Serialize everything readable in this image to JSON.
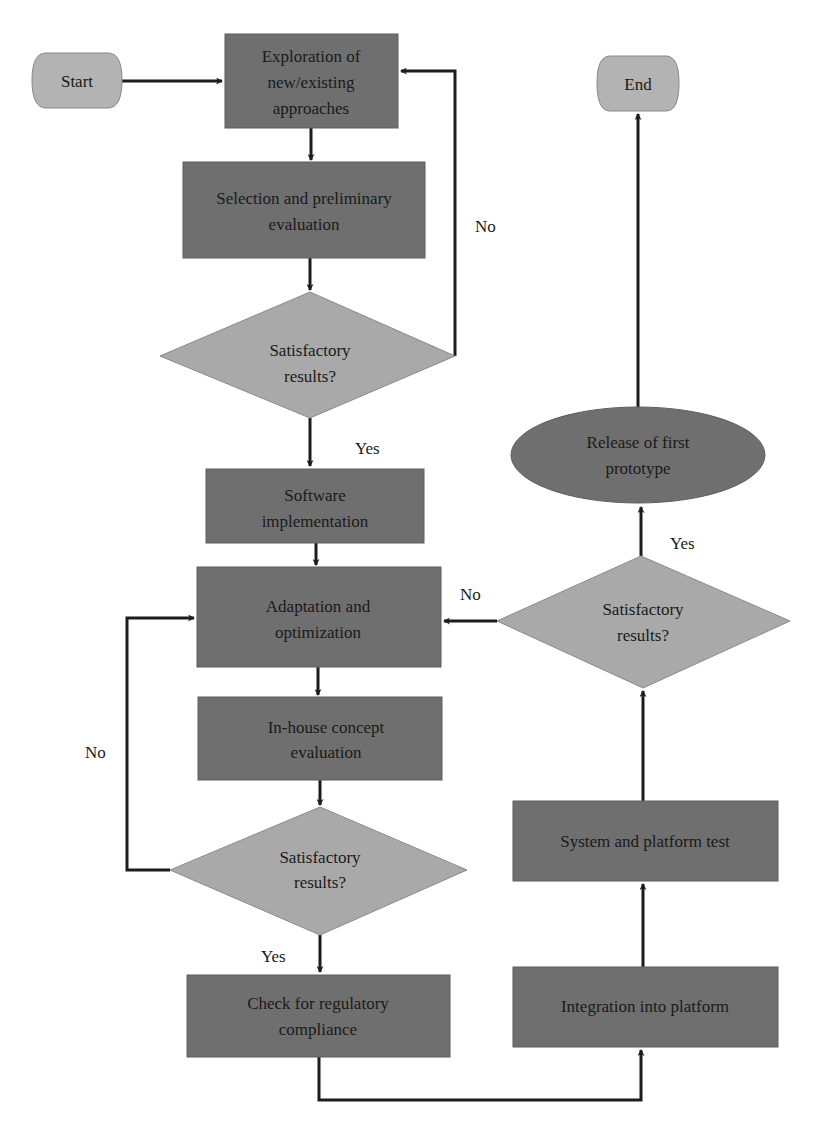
{
  "diagram": {
    "type": "flowchart",
    "colors": {
      "process": "#6f6f6f",
      "decision": "#a9a9a9",
      "terminal": "#b3b3b3",
      "line": "#1c1c1c"
    },
    "nodes": {
      "start": {
        "label": "Start"
      },
      "end": {
        "label": "End"
      },
      "exploration": {
        "lines": [
          "Exploration of",
          "new/existing",
          "approaches"
        ]
      },
      "selection": {
        "lines": [
          "Selection and preliminary",
          "evaluation"
        ]
      },
      "decision1": {
        "lines": [
          "Satisfactory",
          "results?"
        ]
      },
      "software": {
        "lines": [
          "Software",
          "implementation"
        ]
      },
      "adaptation": {
        "lines": [
          "Adaptation and",
          "optimization"
        ]
      },
      "inhouse": {
        "lines": [
          "In-house concept",
          "evaluation"
        ]
      },
      "decision2": {
        "lines": [
          "Satisfactory",
          "results?"
        ]
      },
      "regulatory": {
        "lines": [
          "Check for regulatory",
          "compliance"
        ]
      },
      "integration": {
        "label": "Integration into platform"
      },
      "systemtest": {
        "label": "System and platform test"
      },
      "decision3": {
        "lines": [
          "Satisfactory",
          "results?"
        ]
      },
      "release": {
        "lines": [
          "Release of first",
          "prototype"
        ]
      }
    },
    "edge_labels": {
      "d1_no": "No",
      "d1_yes": "Yes",
      "d2_no": "No",
      "d2_yes": "Yes",
      "d3_no": "No",
      "d3_yes": "Yes"
    }
  }
}
